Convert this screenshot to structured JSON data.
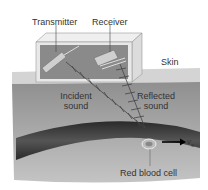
{
  "labels": {
    "transmitter": "Transmitter",
    "receiver": "Receiver",
    "skin": "Skin",
    "incident_line1": "Incident",
    "incident_line2": "sound",
    "reflected_line1": "Reflected",
    "reflected_line2": "sound",
    "red_blood_cell": "Red blood cell",
    "velocity": "v",
    "velocity_sub": "s"
  },
  "colors": {
    "skin_surface": "#d6d6d6",
    "tissue": "#a9a9a9",
    "vessel": "#3a3a3a",
    "box_frame": "#e6e6e6",
    "box_inner": "#8c8c8c",
    "text": "#333333"
  }
}
